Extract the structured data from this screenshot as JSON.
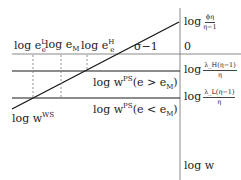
{
  "diagram": {
    "axis_label": "log w",
    "right_labels": {
      "top": {
        "prefix": "log",
        "num": "ϕη",
        "den": "η−1"
      },
      "zero": "0",
      "high": {
        "prefix": "log",
        "num": "λ_H(η−1)",
        "den": "η"
      },
      "low": {
        "prefix": "log",
        "num": "λ_L(η−1)",
        "den": "η"
      }
    },
    "top_labels": {
      "eL": {
        "base": "log e",
        "sup": "L",
        "sub": "e"
      },
      "eM": {
        "base": "log e",
        "sub": "M"
      },
      "eH": {
        "base": "log e",
        "sup": "H",
        "sub": "e"
      },
      "slope": "σ−1"
    },
    "line_labels": {
      "ps_high": {
        "base": "log w",
        "sup": "PS",
        "cond": "(e > e",
        "cond_sub": "M",
        "close": ")"
      },
      "ps_low": {
        "base": "log w",
        "sup": "PS",
        "cond": "(e < e",
        "cond_sub": "M",
        "close": ")"
      },
      "ws": {
        "base": "log w",
        "sup": "WS"
      }
    },
    "colors": {
      "line": "#1a1a1a",
      "axis": "#888888",
      "dashed": "#777777"
    }
  }
}
